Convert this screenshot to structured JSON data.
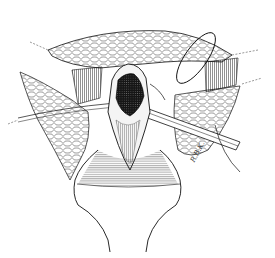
{
  "illustration": {
    "subject": "surgical-illustration-line-drawing",
    "style": "black ink on white",
    "colors": {
      "ink": "#111111",
      "background": "#ffffff",
      "dark_fill": "#1a1a1a"
    },
    "signature": "R.B.K."
  }
}
